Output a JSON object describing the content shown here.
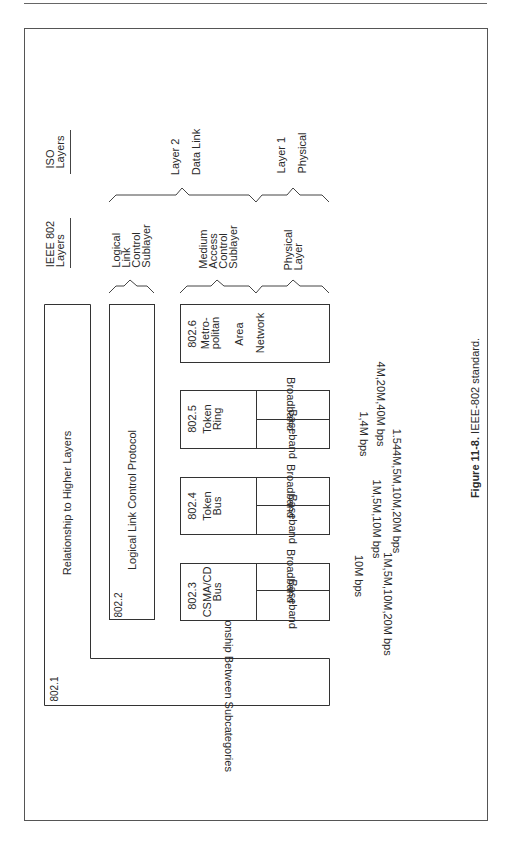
{
  "figure": {
    "caption_number": "Figure 11-8.",
    "caption_text": " IEEE-802 standard."
  },
  "headers": {
    "iso": [
      "ISO",
      "Layers"
    ],
    "ieee": [
      "IEEE 802",
      "Layers"
    ]
  },
  "iso_layers": [
    {
      "label": [
        "Layer 2",
        "Data Link"
      ]
    },
    {
      "label": [
        "Layer 1",
        "Physical"
      ]
    }
  ],
  "ieee_sublayers": [
    {
      "label": [
        "Logical",
        "Link",
        "Control",
        "Sublayer"
      ]
    },
    {
      "label": [
        "Medium",
        "Access",
        "Control",
        "Sublayer"
      ]
    },
    {
      "label": [
        "Physical",
        "Layer"
      ]
    }
  ],
  "standards": {
    "s8021": {
      "id": "802.1",
      "title": "Relationship to Higher Layers",
      "subtitle": "Relationship Between Subcategories"
    },
    "s8022": {
      "id": "802.2",
      "title": "Logical Link Control Protocol"
    },
    "s8026": {
      "id": "802.6",
      "name": [
        "Metro-",
        "politan",
        "Area",
        "Network"
      ]
    },
    "s8025": {
      "id": "802.5",
      "name": [
        "Token",
        "Ring"
      ],
      "broadband": "Broadband",
      "baseband": "Baseband",
      "broadband_speed": "4M,20M,40M bps",
      "baseband_speed": "1,4M bps"
    },
    "s8024": {
      "id": "802.4",
      "name": [
        "Token",
        "Bus"
      ],
      "broadband": "Broadband",
      "baseband": "Baseband",
      "broadband_speed": "1.544M,5M,10M,20M bps",
      "baseband_speed": "1M,5M,10M bps"
    },
    "s8023": {
      "id": "802.3",
      "name": [
        "CSMA/CD",
        "Bus"
      ],
      "broadband": "Broadband",
      "baseband": "Baseband",
      "broadband_speed": "10M bps",
      "baseband_speed": "1M,5M,10M,20M bps"
    }
  }
}
